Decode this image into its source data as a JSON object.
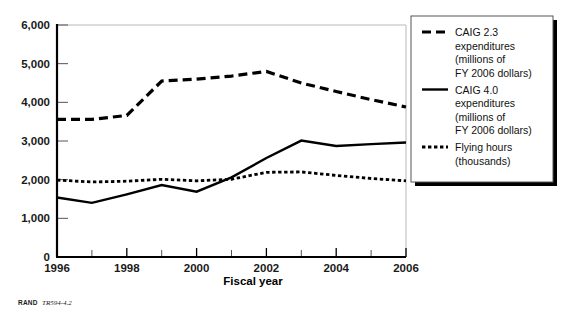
{
  "figure": {
    "caption_prefix": "RAND",
    "caption_id": "TR594-4.2"
  },
  "chart_data": {
    "type": "line",
    "title": "",
    "xlabel": "Fiscal year",
    "ylabel": "",
    "xlim": [
      1996,
      2006
    ],
    "ylim": [
      0,
      6000
    ],
    "grid": false,
    "legend_position": "right-outside",
    "x": [
      1996,
      1997,
      1998,
      1999,
      2000,
      2001,
      2002,
      2003,
      2004,
      2005,
      2006
    ],
    "xticklabels": [
      "1996",
      "1998",
      "2000",
      "2002",
      "2004",
      "2006"
    ],
    "xticks_major": [
      1996,
      1998,
      2000,
      2002,
      2004,
      2006
    ],
    "xticks_minor": [
      1997,
      1999,
      2001,
      2003,
      2005
    ],
    "yticklabels": [
      "0",
      "1,000",
      "2,000",
      "3,000",
      "4,000",
      "5,000",
      "6,000"
    ],
    "yticks": [
      0,
      1000,
      2000,
      3000,
      4000,
      5000,
      6000
    ],
    "series": [
      {
        "name": "CAIG 2.3 expenditures (millions of FY 2006 dollars)",
        "legend_label_lines": [
          "CAIG 2.3",
          "expenditures",
          "(millions of",
          "FY 2006 dollars)"
        ],
        "style": "dashed",
        "dasharray": "9,5",
        "width": 3.2,
        "color": "#000000",
        "values": [
          3560,
          3560,
          3660,
          4550,
          4600,
          4680,
          4800,
          4500,
          4280,
          4070,
          3880
        ]
      },
      {
        "name": "CAIG 4.0 expenditures (millions of FY 2006 dollars)",
        "legend_label_lines": [
          "CAIG 4.0",
          "expenditures",
          "(millions of",
          "FY 2006 dollars)"
        ],
        "style": "solid",
        "dasharray": "",
        "width": 2.4,
        "color": "#000000",
        "values": [
          1540,
          1400,
          1620,
          1860,
          1690,
          2060,
          2560,
          3010,
          2870,
          2920,
          2960
        ]
      },
      {
        "name": "Flying hours (thousands)",
        "legend_label_lines": [
          "Flying hours",
          "(thousands)"
        ],
        "style": "dotted",
        "dasharray": "3.4,2.6",
        "width": 2.8,
        "color": "#000000",
        "values": [
          1990,
          1940,
          1960,
          2010,
          1970,
          2010,
          2190,
          2200,
          2110,
          2030,
          1970
        ]
      }
    ]
  }
}
